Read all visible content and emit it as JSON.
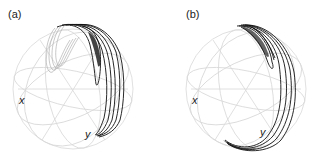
{
  "figure": {
    "panels": [
      {
        "id": "a",
        "label": "(a)",
        "axes": {
          "x_label": "x",
          "y_label": "y"
        },
        "description": "Wireframe sphere with multiple black trajectory loops on upper-right hemisphere; grey back-side traces on upper left"
      },
      {
        "id": "b",
        "label": "(b)",
        "axes": {
          "x_label": "x",
          "y_label": "y"
        },
        "description": "Wireframe sphere with black trajectory loops hugging right edge, converging at top and bottom"
      }
    ],
    "colors": {
      "grid": "#d8d8d8",
      "trajectory": "#111111",
      "back_trajectory": "#b0b0b0",
      "text": "#222222"
    }
  }
}
